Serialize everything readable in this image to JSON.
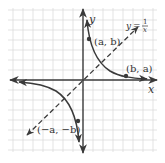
{
  "diagram": {
    "type": "coordinate-graph",
    "equation_label": {
      "lhs": "y",
      "eq": "=",
      "numerator": "1",
      "denominator": "x"
    },
    "axes": {
      "x_label": "x",
      "y_label": "y"
    },
    "points": [
      {
        "label": "(a, b)"
      },
      {
        "label": "(b, a)"
      },
      {
        "label": "(−a, −b)"
      }
    ],
    "reference_line": "y = x (dashed)",
    "colors": {
      "grid": "#d9d9d9",
      "axis": "#3a3a3a",
      "curve": "#3a3a3a",
      "dashed_line": "#3a3a3a",
      "text": "#333333"
    }
  }
}
